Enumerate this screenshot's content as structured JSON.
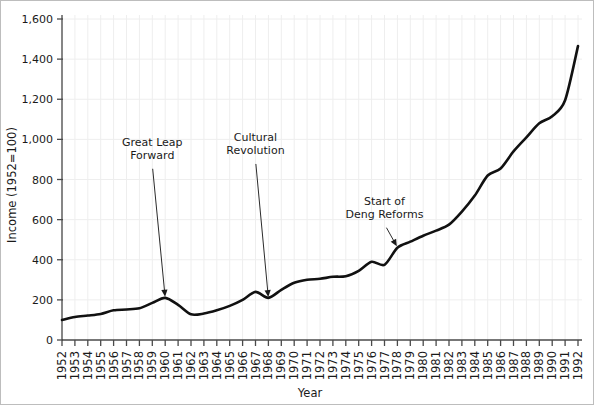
{
  "chart_data": {
    "type": "line",
    "title": "",
    "xlabel": "Year",
    "ylabel": "Income (1952=100)",
    "xlim": [
      1952,
      1992
    ],
    "ylim": [
      0,
      1600
    ],
    "grid": true,
    "legend": "none",
    "y_ticks": [
      0,
      200,
      400,
      600,
      800,
      1000,
      1200,
      1400,
      1600
    ],
    "y_tick_labels": [
      "0",
      "200",
      "400",
      "600",
      "800",
      "1,000",
      "1,200",
      "1,400",
      "1,600"
    ],
    "x": [
      1952,
      1953,
      1954,
      1955,
      1956,
      1957,
      1958,
      1959,
      1960,
      1961,
      1962,
      1963,
      1964,
      1965,
      1966,
      1967,
      1968,
      1969,
      1970,
      1971,
      1972,
      1973,
      1974,
      1975,
      1976,
      1977,
      1978,
      1979,
      1980,
      1981,
      1982,
      1983,
      1984,
      1985,
      1986,
      1987,
      1988,
      1989,
      1990,
      1991,
      1992
    ],
    "categories": [
      "1952",
      "1953",
      "1954",
      "1955",
      "1956",
      "1957",
      "1958",
      "1959",
      "1960",
      "1961",
      "1962",
      "1963",
      "1964",
      "1965",
      "1966",
      "1967",
      "1968",
      "1969",
      "1970",
      "1971",
      "1972",
      "1973",
      "1974",
      "1975",
      "1976",
      "1977",
      "1978",
      "1979",
      "1980",
      "1981",
      "1982",
      "1983",
      "1984",
      "1985",
      "1986",
      "1987",
      "1988",
      "1989",
      "1990",
      "1991",
      "1992"
    ],
    "series": [
      {
        "name": "Income index",
        "color": "#111111",
        "values": [
          100,
          115,
          122,
          130,
          148,
          152,
          158,
          185,
          210,
          175,
          128,
          132,
          148,
          170,
          200,
          240,
          210,
          250,
          285,
          300,
          305,
          315,
          318,
          345,
          390,
          375,
          460,
          490,
          520,
          545,
          575,
          640,
          720,
          820,
          855,
          940,
          1010,
          1080,
          1115,
          1195,
          1465
        ]
      }
    ],
    "annotations": [
      {
        "name": "great-leap-forward",
        "label_lines": [
          "Great Leap",
          "Forward"
        ],
        "text_x": 0.175,
        "text_y": 0.605,
        "point_year": 1960,
        "point_value": 210
      },
      {
        "name": "cultural-revolution",
        "label_lines": [
          "Cultural",
          "Revolution"
        ],
        "text_x": 0.375,
        "text_y": 0.62,
        "point_year": 1968,
        "point_value": 208
      },
      {
        "name": "start-of-deng-reforms",
        "label_lines": [
          "Start of",
          "Deng Reforms"
        ],
        "text_x": 0.625,
        "text_y": 0.42,
        "point_year": 1978,
        "point_value": 462
      }
    ]
  },
  "colors": {
    "line": "#111111",
    "axis": "#4a4a4a",
    "grid": "#eeeeee",
    "text": "#1a1a1a",
    "border": "#bdbdbd",
    "background": "#ffffff"
  }
}
